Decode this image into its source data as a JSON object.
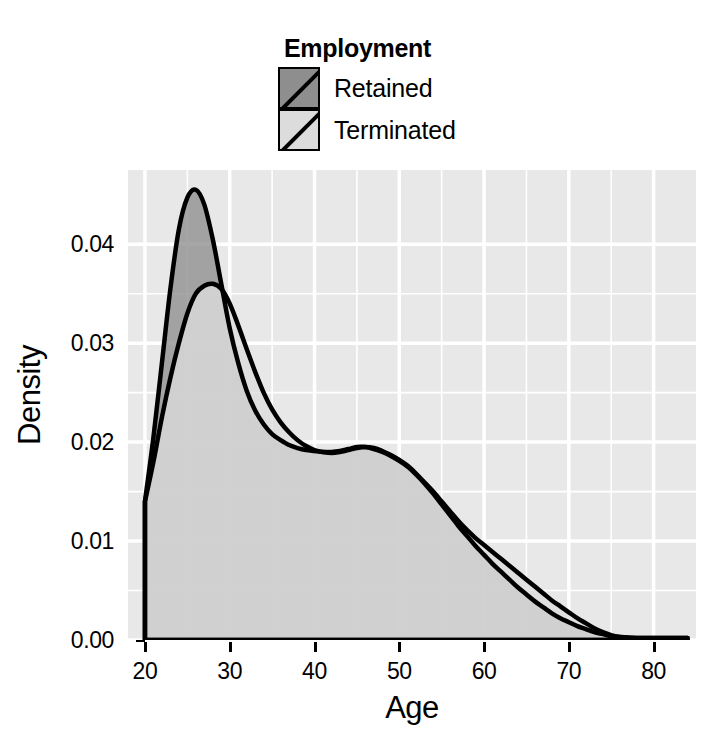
{
  "chart_data": {
    "type": "area",
    "title": "",
    "xlabel": "Age",
    "ylabel": "Density",
    "xlim": [
      18,
      85
    ],
    "ylim": [
      0.0,
      0.0475
    ],
    "grid": true,
    "legend": {
      "title": "Employment",
      "position": "top",
      "entries": [
        {
          "name": "Retained",
          "fill": "#8e8e8e"
        },
        {
          "name": "Terminated",
          "fill": "#dcdcdc"
        }
      ]
    },
    "xticks": [
      20,
      30,
      40,
      50,
      60,
      70,
      80
    ],
    "xtick_labels": [
      "20",
      "30",
      "40",
      "50",
      "60",
      "70",
      "80"
    ],
    "yticks": [
      0.0,
      0.01,
      0.02,
      0.03,
      0.04
    ],
    "ytick_labels": [
      "0.00",
      "0.01",
      "0.02",
      "0.03",
      "0.04"
    ],
    "x": [
      20,
      21,
      22,
      23,
      24,
      25,
      26,
      27,
      28,
      29,
      30,
      31,
      32,
      33,
      34,
      35,
      36,
      37,
      38,
      39,
      40,
      41,
      42,
      43,
      44,
      45,
      46,
      47,
      48,
      49,
      50,
      51,
      52,
      53,
      54,
      55,
      56,
      57,
      58,
      59,
      60,
      61,
      62,
      63,
      64,
      65,
      66,
      67,
      68,
      69,
      70,
      71,
      72,
      73,
      74,
      75,
      76,
      78,
      80,
      82,
      84
    ],
    "series": [
      {
        "name": "Retained",
        "fill": "#8e8e8e",
        "line": "#000000",
        "values": [
          0.014,
          0.0205,
          0.028,
          0.0355,
          0.0415,
          0.0447,
          0.0455,
          0.044,
          0.0405,
          0.036,
          0.0315,
          0.028,
          0.0252,
          0.0232,
          0.0218,
          0.0208,
          0.0202,
          0.0197,
          0.0194,
          0.0192,
          0.0191,
          0.019,
          0.019,
          0.0191,
          0.0193,
          0.0195,
          0.0195,
          0.0193,
          0.019,
          0.0186,
          0.0181,
          0.0175,
          0.0167,
          0.0158,
          0.0148,
          0.0137,
          0.0126,
          0.0115,
          0.0105,
          0.0095,
          0.0086,
          0.0077,
          0.0069,
          0.0061,
          0.0053,
          0.0046,
          0.0039,
          0.0033,
          0.0027,
          0.0022,
          0.0018,
          0.0014,
          0.0011,
          0.0008,
          0.0006,
          0.0004,
          0.0003,
          0.0002,
          0.0002,
          0.0002,
          0.0002
        ]
      },
      {
        "name": "Terminated",
        "fill": "#dcdcdc",
        "line": "#000000",
        "values": [
          0.014,
          0.018,
          0.0225,
          0.0265,
          0.03,
          0.033,
          0.035,
          0.0358,
          0.036,
          0.0355,
          0.034,
          0.0318,
          0.0294,
          0.0271,
          0.025,
          0.0233,
          0.022,
          0.021,
          0.0202,
          0.0196,
          0.0192,
          0.019,
          0.0189,
          0.019,
          0.0192,
          0.0194,
          0.0195,
          0.0194,
          0.0191,
          0.0187,
          0.0182,
          0.0176,
          0.0168,
          0.0159,
          0.015,
          0.014,
          0.013,
          0.012,
          0.0111,
          0.0103,
          0.0096,
          0.0089,
          0.0082,
          0.0075,
          0.0068,
          0.0061,
          0.0054,
          0.0047,
          0.004,
          0.0034,
          0.0028,
          0.0022,
          0.0017,
          0.0012,
          0.0008,
          0.0005,
          0.0003,
          0.0002,
          0.0002,
          0.0002,
          0.0002
        ]
      }
    ],
    "annotations": [
      {
        "text": "Retained peak",
        "x": 26,
        "y": 0.0455
      },
      {
        "text": "Terminated peak",
        "x": 28,
        "y": 0.036
      },
      {
        "text": "Secondary shoulder",
        "x": 46,
        "y": 0.0195
      }
    ],
    "panel_background": "#e8e8e8",
    "gridline_color": "#ffffff"
  }
}
